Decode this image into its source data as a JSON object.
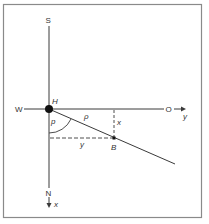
{
  "diagram": {
    "labels": {
      "south": "S",
      "west": "W",
      "east": "O",
      "north": "N",
      "origin": "H",
      "point": "B",
      "angle": "p",
      "distance": "ρ",
      "x_offset": "x",
      "y_offset": "y",
      "y_axis": "y",
      "x_axis": "x"
    },
    "colors": {
      "frame": "#8a8a8a",
      "line": "#3a3a3a",
      "dot": "#111111"
    }
  }
}
